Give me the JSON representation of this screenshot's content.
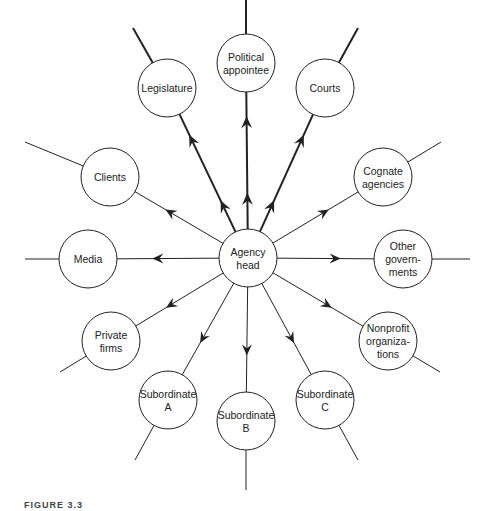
{
  "diagram": {
    "type": "hub-and-spoke",
    "center": {
      "id": "agency-head",
      "lines": [
        "Agency",
        "head"
      ],
      "x": 248,
      "y": 258
    },
    "radius": 29,
    "nodes": [
      {
        "id": "political-appointee",
        "lines": [
          "Political",
          "appointee"
        ],
        "x": 246,
        "y": 63,
        "heavy": true,
        "arrows": 2,
        "outer": [
          246,
          0
        ]
      },
      {
        "id": "legislature",
        "lines": [
          "Legislature"
        ],
        "x": 167,
        "y": 88,
        "heavy": true,
        "arrows": 2,
        "outer": [
          133,
          28
        ]
      },
      {
        "id": "courts",
        "lines": [
          "Courts"
        ],
        "x": 325,
        "y": 88,
        "heavy": true,
        "arrows": 2,
        "outer": [
          358,
          28
        ]
      },
      {
        "id": "clients",
        "lines": [
          "Clients"
        ],
        "x": 110,
        "y": 177,
        "heavy": false,
        "arrows": 1,
        "outer": [
          25,
          142
        ]
      },
      {
        "id": "cognate-agencies",
        "lines": [
          "Cognate",
          "agencies"
        ],
        "x": 383,
        "y": 177,
        "heavy": false,
        "arrows": 1,
        "outer": [
          441,
          142
        ]
      },
      {
        "id": "media",
        "lines": [
          "Media"
        ],
        "x": 88,
        "y": 259,
        "heavy": false,
        "arrows": 1,
        "outer": [
          25,
          259
        ]
      },
      {
        "id": "other-governments",
        "lines": [
          "Other",
          "govern-",
          "ments"
        ],
        "x": 403,
        "y": 259,
        "heavy": false,
        "arrows": 1,
        "outer": [
          470,
          259
        ]
      },
      {
        "id": "private-firms",
        "lines": [
          "Private",
          "firms"
        ],
        "x": 111,
        "y": 341,
        "heavy": false,
        "arrows": 1,
        "outer": [
          60,
          372
        ]
      },
      {
        "id": "nonprofit-organizations",
        "lines": [
          "Nonprofit",
          "organiza-",
          "tions"
        ],
        "x": 388,
        "y": 341,
        "heavy": false,
        "arrows": 1,
        "outer": [
          440,
          372
        ]
      },
      {
        "id": "subordinate-a",
        "lines": [
          "Subordinate",
          "A"
        ],
        "x": 168,
        "y": 400,
        "heavy": false,
        "arrows": 1,
        "outer": [
          135,
          460
        ]
      },
      {
        "id": "subordinate-b",
        "lines": [
          "Subordinate",
          "B"
        ],
        "x": 246,
        "y": 421,
        "heavy": false,
        "arrows": 1,
        "outer": [
          246,
          490
        ]
      },
      {
        "id": "subordinate-c",
        "lines": [
          "Subordinate",
          "C"
        ],
        "x": 325,
        "y": 400,
        "heavy": false,
        "arrows": 1,
        "outer": [
          358,
          460
        ]
      }
    ],
    "colors": {
      "stroke": "#222222",
      "fill": "#ffffff",
      "text": "#222222"
    }
  },
  "caption": {
    "text": "FIGURE 3.3"
  }
}
